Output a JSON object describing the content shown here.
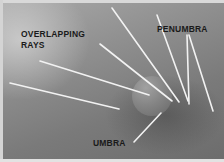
{
  "figure": {
    "type": "annotated-photo",
    "labels": {
      "overlapping": "OVERLAPPING",
      "rays": "RAYS",
      "penumbra": "PENUMBRA",
      "umbra": "UMBRA"
    },
    "colors": {
      "ray": "#f2f2f2",
      "label": "#1a1a1a",
      "background": "#8a8a8a"
    }
  }
}
